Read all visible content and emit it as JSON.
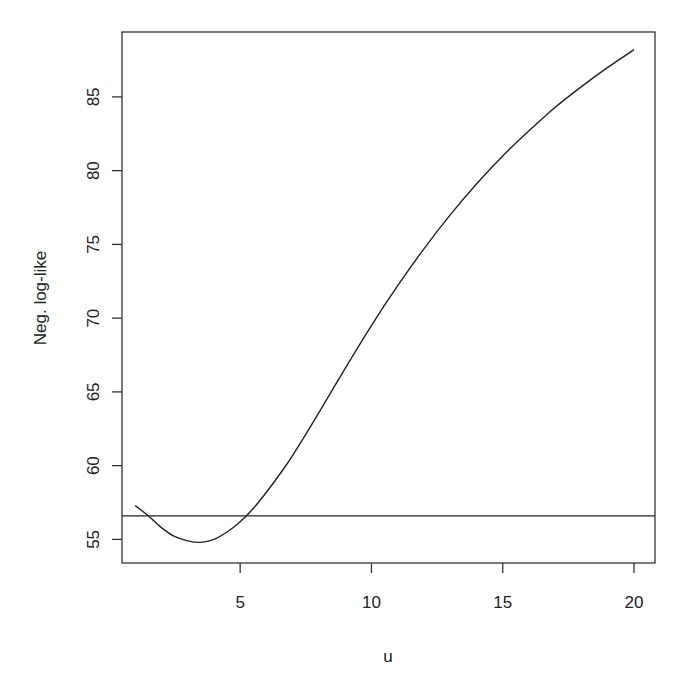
{
  "chart_data": {
    "type": "line",
    "title": "",
    "xlabel": "u",
    "ylabel": "Neg. log-like",
    "xlim": [
      0.5,
      20.8
    ],
    "ylim": [
      53.4,
      89.4
    ],
    "x_ticks": [
      5,
      10,
      15,
      20
    ],
    "y_ticks": [
      55,
      60,
      65,
      70,
      75,
      80,
      85
    ],
    "grid": false,
    "legend": null,
    "series": [
      {
        "name": "negative log-likelihood profile",
        "x": [
          1.0,
          1.5,
          2.0,
          2.5,
          3.0,
          3.5,
          4.0,
          4.5,
          5.0,
          5.5,
          6.0,
          6.5,
          7.0,
          8.0,
          9.0,
          10.0,
          11.0,
          12.0,
          13.0,
          14.0,
          15.0,
          16.0,
          17.0,
          18.0,
          19.0,
          20.0
        ],
        "values": [
          57.3,
          56.6,
          55.8,
          55.2,
          54.9,
          54.8,
          55.0,
          55.5,
          56.2,
          57.1,
          58.2,
          59.4,
          60.7,
          63.6,
          66.6,
          69.5,
          72.2,
          74.7,
          77.0,
          79.1,
          81.0,
          82.7,
          84.3,
          85.7,
          87.0,
          88.2
        ]
      }
    ],
    "reference_lines": [
      {
        "orientation": "horizontal",
        "y": 56.6,
        "label": ""
      }
    ]
  },
  "axes": {
    "xlabel": "u",
    "ylabel": "Neg. log-like",
    "x_tick_labels": [
      "5",
      "10",
      "15",
      "20"
    ],
    "y_tick_labels": [
      "55",
      "60",
      "65",
      "70",
      "75",
      "80",
      "85"
    ]
  },
  "colors": {
    "line": "#222222",
    "axis": "#333333",
    "background": "#ffffff"
  }
}
